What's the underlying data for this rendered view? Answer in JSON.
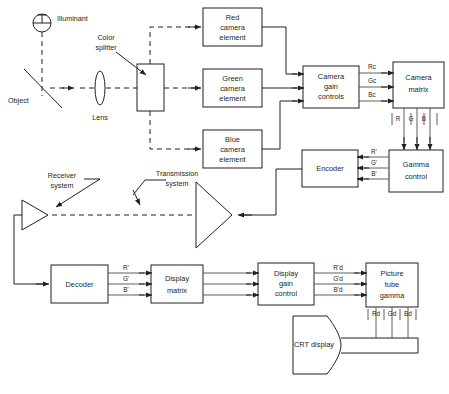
{
  "diagram": {
    "type": "block-diagram",
    "background_color": "#ffffff",
    "line_color": "#231f20",
    "width": 449,
    "height": 394
  },
  "optics": {
    "illuminant_label": "Illuminant",
    "object_label": "Object",
    "lens_label": "Lens",
    "color_splitter_label": "Color\nsplitter",
    "color_splitter_line1": "Color",
    "color_splitter_line2": "splitter"
  },
  "camera_elements": [
    {
      "line1": "Red",
      "line2": "camera",
      "line3": "element"
    },
    {
      "line1": "Green",
      "line2": "camera",
      "line3": "element"
    },
    {
      "line1": "Blue",
      "line2": "camera",
      "line3": "element"
    }
  ],
  "blocks": {
    "camera_gain": {
      "line1": "Camera",
      "line2": "gain",
      "line3": "controls"
    },
    "camera_matrix": {
      "line1": "Camera",
      "line2": "matrix"
    },
    "gamma_control": {
      "line1": "Gamma",
      "line2": "control"
    },
    "encoder": {
      "line1": "Encoder"
    },
    "decoder": {
      "line1": "Decoder"
    },
    "display_matrix": {
      "line1": "Display",
      "line2": "matrix"
    },
    "display_gain": {
      "line1": "Display",
      "line2": "gain",
      "line3": "control"
    },
    "picture_tube_gamma": {
      "line1": "Picture",
      "line2": "tube",
      "line3": "gamma"
    },
    "crt_display": {
      "label": "CRT display"
    }
  },
  "signals": {
    "camera_gain_out": [
      "Rc",
      "Gc",
      "Bc"
    ],
    "camera_matrix_out": [
      "R",
      "G",
      "B"
    ],
    "gamma_out": [
      "R'",
      "G'",
      "B'"
    ],
    "decoder_out": [
      "R'",
      "G'",
      "B'"
    ],
    "display_gain_out": [
      "R'd",
      "G'd",
      "B'd"
    ],
    "picture_tube_out": [
      "Rd",
      "Gd",
      "Bd"
    ]
  },
  "transmission": {
    "receiver_label_line1": "Receiver",
    "receiver_label_line2": "system",
    "transmission_label_line1": "Transmission",
    "transmission_label_line2": "system"
  }
}
